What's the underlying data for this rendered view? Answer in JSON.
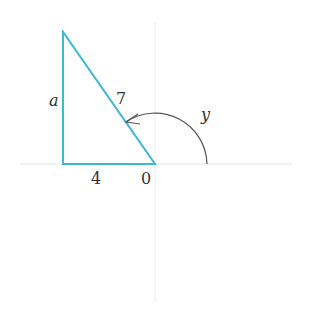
{
  "diagram": {
    "labels": {
      "side_vertical": "a",
      "hypotenuse": "7",
      "side_horizontal": "4",
      "origin": "0",
      "angle": "y"
    },
    "colors": {
      "triangle": "#3bb8d6",
      "axes": "#e6e6e6",
      "arc": "#555555",
      "text": "#333333"
    }
  }
}
